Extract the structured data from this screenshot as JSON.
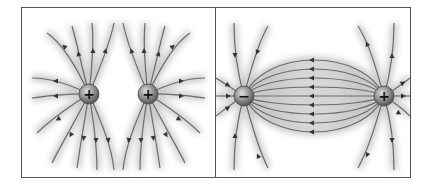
{
  "figure": {
    "panels": [
      {
        "id": "like-charges",
        "description": "Field lines of two positive charges repelling",
        "charges": [
          {
            "sign": "+",
            "label": "+"
          },
          {
            "sign": "+",
            "label": "+"
          }
        ]
      },
      {
        "id": "opposite-charges",
        "description": "Field lines of a dipole (negative and positive charge)",
        "charges": [
          {
            "sign": "-",
            "label": "−"
          },
          {
            "sign": "+",
            "label": "+"
          }
        ]
      }
    ],
    "colors": {
      "line": "#6a6a6a",
      "glow": "#c8c8c8",
      "border": "#555555",
      "charge_fill": "#8a8a8a"
    }
  }
}
